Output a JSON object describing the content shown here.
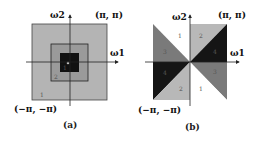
{
  "panels": [
    {
      "id": "a",
      "caption": "(a)",
      "axis_x_label": "ω1",
      "axis_y_label": "ω2",
      "corner_top_right": "(π, π)",
      "corner_bottom_left": "(−π, −π)",
      "region_labels": [
        "1",
        "2",
        "3"
      ],
      "colors": {
        "outer": "#b4b4b4",
        "middle": "#8c8c8c",
        "inner": "#111111",
        "border": "#333333"
      }
    },
    {
      "id": "b",
      "caption": "(b)",
      "axis_x_label": "ω1",
      "axis_y_label": "ω2",
      "corner_top_right": "(π, π)",
      "corner_bottom_left": "(−π, −π)",
      "region_labels": [
        "1",
        "2",
        "3",
        "4",
        "1",
        "2",
        "3",
        "4"
      ],
      "colors": {
        "white": "#ffffff",
        "light": "#b8b8b8",
        "medium": "#7a7a7a",
        "dark": "#151515"
      }
    }
  ]
}
